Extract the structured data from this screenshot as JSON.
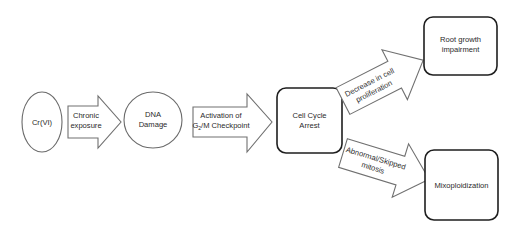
{
  "diagram": {
    "type": "flowchart",
    "nodes": [
      {
        "id": "crvi",
        "shape": "ellipse",
        "label": "Cr(VI)"
      },
      {
        "id": "dna",
        "shape": "ellipse",
        "line1": "DNA",
        "line2": "Damage"
      },
      {
        "id": "arrest",
        "shape": "rounded-box",
        "line1": "Cell Cycle",
        "line2": "Arrest"
      },
      {
        "id": "root",
        "shape": "rounded-box",
        "line1": "Root growth",
        "line2": "impairment"
      },
      {
        "id": "mixo",
        "shape": "rounded-box",
        "label": "Mixoploidization"
      }
    ],
    "arrows": [
      {
        "id": "chronic",
        "from": "crvi",
        "to": "dna",
        "line1": "Chronic",
        "line2": "exposure"
      },
      {
        "id": "activation",
        "from": "dna",
        "to": "arrest",
        "line1": "Activation of",
        "line2_main": "G",
        "line2_sub": "2",
        "line2_rest": "/M Checkpoint"
      },
      {
        "id": "decrease",
        "from": "arrest",
        "to": "root",
        "line1": "Decrease in cell",
        "line2": "proliferation"
      },
      {
        "id": "abnormal",
        "from": "arrest",
        "to": "mixo",
        "line1": "Abnormal/Skipped",
        "line2": "mitosis"
      }
    ]
  }
}
